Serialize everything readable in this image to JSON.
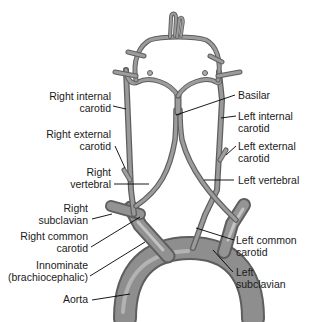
{
  "diagram": {
    "background_color": "#ffffff",
    "vessel_color": "#8c8c8c",
    "vessel_highlight": "#c8c8c8",
    "vessel_outline": "#5e5e5e",
    "label_color": "#1a1a1a",
    "leader_color": "#000000"
  },
  "labels": {
    "right_internal_carotid": {
      "line1": "Right internal",
      "line2": "carotid"
    },
    "right_external_carotid": {
      "line1": "Right external",
      "line2": "carotid"
    },
    "right_vertebral": {
      "line1": "Right",
      "line2": "vertebral"
    },
    "right_subclavian": {
      "line1": "Right",
      "line2": "subclavian"
    },
    "right_common_carotid": {
      "line1": "Right common",
      "line2": "carotid"
    },
    "innominate": {
      "line1": "Innominate",
      "line2": "(brachiocephalic)"
    },
    "aorta": {
      "line1": "Aorta"
    },
    "basilar": {
      "line1": "Basilar"
    },
    "left_internal_carotid": {
      "line1": "Left internal",
      "line2": "carotid"
    },
    "left_external_carotid": {
      "line1": "Left external",
      "line2": "carotid"
    },
    "left_vertebral": {
      "line1": "Left vertebral"
    },
    "left_common_carotid": {
      "line1": "Left common",
      "line2": "carotid"
    },
    "left_subclavian": {
      "line1": "Left",
      "line2": "subclavian"
    }
  }
}
